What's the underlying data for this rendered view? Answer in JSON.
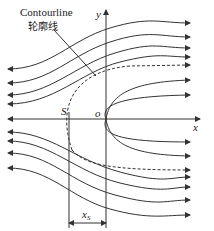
{
  "labels": {
    "contour_en": "Contourline",
    "contour_cn": "轮廓线",
    "y_axis": "y",
    "x_axis": "x",
    "origin": "o",
    "point_s": "S",
    "xs_main": "x",
    "xs_sub": "S"
  },
  "colors": {
    "line": "#333333",
    "text": "#222222",
    "background": "#ffffff"
  }
}
